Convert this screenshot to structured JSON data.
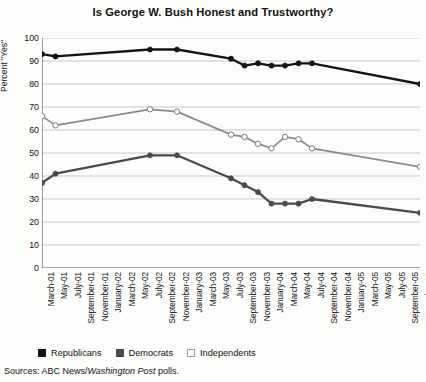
{
  "title": "Is George W. Bush Honest and Trustworthy?",
  "sources": {
    "prefix": "Sources: ABC News/",
    "italic": "Washington Post",
    "suffix": " polls."
  },
  "legend": {
    "position": "bottom-left",
    "items": [
      {
        "label": "Republicans",
        "swatch": "rep",
        "color": "#141414"
      },
      {
        "label": "Democrats",
        "swatch": "dem",
        "color": "#4a4a4a"
      },
      {
        "label": "Independents",
        "swatch": "ind",
        "color": "#ffffff"
      }
    ]
  },
  "chart_data": {
    "type": "line",
    "title": "Is George W. Bush Honest and Trustworthy?",
    "xlabel": "",
    "ylabel": "Percent \"Yes\"",
    "ylim": [
      0,
      100
    ],
    "ytick_step": 10,
    "grid": true,
    "legend_position": "bottom-left",
    "ytick_labels": [
      "0",
      "10",
      "20",
      "30",
      "40",
      "50",
      "60",
      "70",
      "80",
      "90",
      "100"
    ],
    "categories": [
      "March-01",
      "May-01",
      "July-01",
      "September-01",
      "November-01",
      "January-02",
      "March-02",
      "May-02",
      "July-02",
      "September-02",
      "November-02",
      "January-03",
      "March-03",
      "May-03",
      "July-03",
      "September-03",
      "November-03",
      "January-04",
      "March-04",
      "May-04",
      "July-04",
      "September-04",
      "November-04",
      "January-05",
      "March-05",
      "May-05",
      "July-05",
      "September-05",
      "November-05"
    ],
    "series": [
      {
        "name": "Republicans",
        "color": "#141414",
        "marker": "filled-circle",
        "values": [
          93,
          92,
          null,
          null,
          null,
          null,
          null,
          null,
          95,
          null,
          95,
          null,
          null,
          null,
          91,
          88,
          89,
          88,
          88,
          89,
          89,
          null,
          null,
          null,
          null,
          null,
          null,
          null,
          80
        ]
      },
      {
        "name": "Democrats",
        "color": "#4a4a4a",
        "marker": "filled-circle",
        "values": [
          37,
          41,
          null,
          null,
          null,
          null,
          null,
          null,
          49,
          null,
          49,
          null,
          null,
          null,
          39,
          36,
          33,
          28,
          28,
          28,
          30,
          null,
          null,
          null,
          null,
          null,
          null,
          null,
          24
        ]
      },
      {
        "name": "Independents",
        "color": "#888888",
        "marker": "hollow-circle",
        "values": [
          66,
          62,
          null,
          null,
          null,
          null,
          null,
          null,
          69,
          null,
          68,
          null,
          null,
          null,
          58,
          57,
          54,
          52,
          57,
          56,
          52,
          null,
          null,
          null,
          null,
          null,
          null,
          null,
          44
        ]
      }
    ]
  }
}
